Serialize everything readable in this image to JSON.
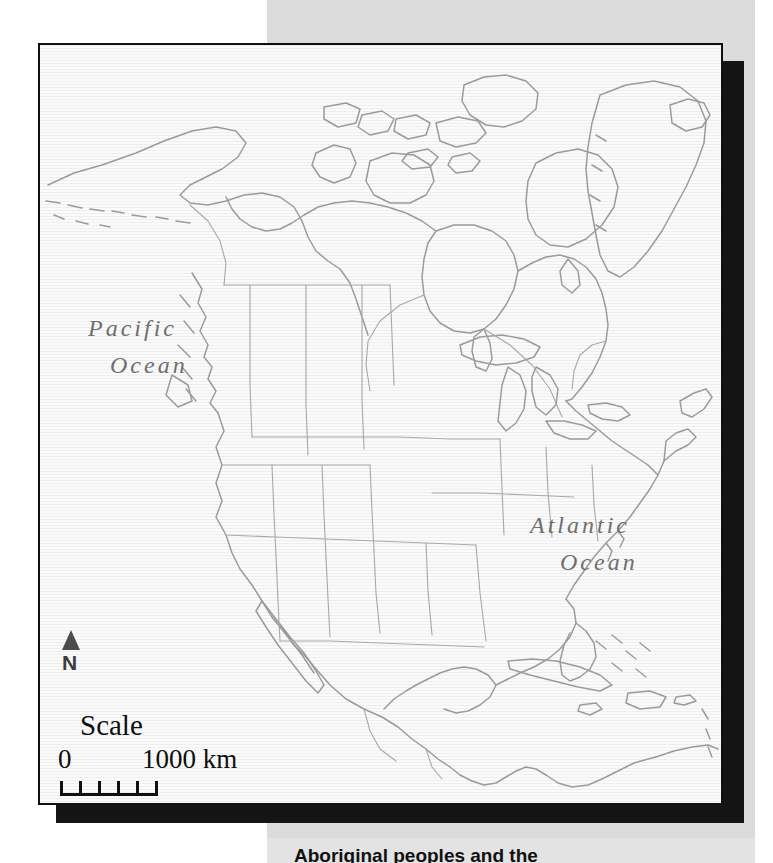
{
  "figure": {
    "kind": "outline-map",
    "region": "North America",
    "frame_border_color": "#111111",
    "map_background_color": "#fbfbfb",
    "coastline_color": "#9a9a9a",
    "page_panel_color": "#dcdcdc",
    "shadow_color": "#141414"
  },
  "labels": {
    "pacific_line1": "Pacific",
    "pacific_line2": "Ocean",
    "atlantic_line1": "Atlantic",
    "atlantic_line2": "Ocean"
  },
  "north_arrow": {
    "icon": "north-arrow-icon",
    "label": "N"
  },
  "scale": {
    "title": "Scale",
    "min_label": "0",
    "max_label": "1000 km",
    "segments": 5,
    "unit": "km",
    "max_value": 1000
  },
  "caption": {
    "text": "Aboriginal peoples and the",
    "clipped": true
  }
}
